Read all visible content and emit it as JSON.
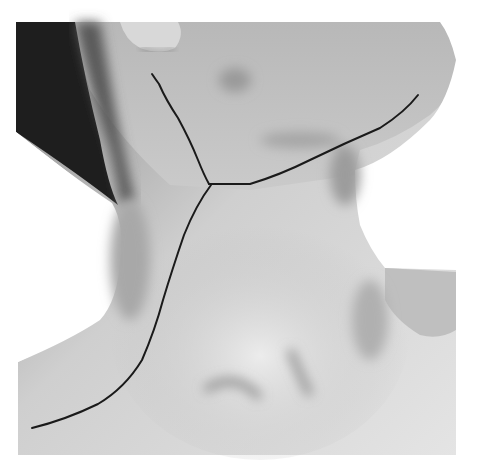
{
  "image": {
    "description": "Grayscale photograph of a neck in left-oblique view with a drawn Y-shaped incision line",
    "subject": "neck",
    "annotation": {
      "type": "incision-line",
      "color": "#1a1a1a",
      "branches": [
        "upper-branch",
        "jaw-branch",
        "lower-branch"
      ]
    }
  }
}
